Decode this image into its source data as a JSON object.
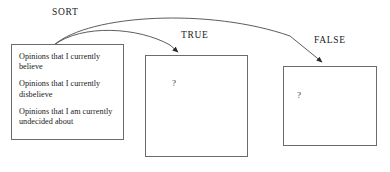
{
  "diagram": {
    "stroke_color": "#6b6b6b",
    "text_color": "#1a1a1a",
    "background": "#ffffff"
  },
  "source_box": {
    "name": "opinions-box",
    "items": [
      "Opinions that I currently believe",
      "Opinions that I currently disbelieve",
      "Opinions that I am currently undecided about"
    ]
  },
  "edges": [
    {
      "label": "SORT",
      "from": "opinions-box",
      "to": "true-box"
    },
    {
      "label": "TRUE",
      "from": "opinions-box",
      "to": "true-box"
    },
    {
      "label": "FALSE",
      "from": "opinions-box",
      "to": "false-box"
    }
  ],
  "labels": {
    "sort": "SORT",
    "true": "TRUE",
    "false": "FALSE"
  },
  "true_box": {
    "name": "true-box",
    "content": "?"
  },
  "false_box": {
    "name": "false-box",
    "content": "?"
  }
}
